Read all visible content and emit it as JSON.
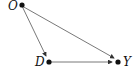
{
  "diagram": {
    "type": "causal-dag",
    "nodes": [
      {
        "id": "O",
        "label": "O"
      },
      {
        "id": "D",
        "label": "D"
      },
      {
        "id": "Y",
        "label": "Y"
      }
    ],
    "edges": [
      {
        "from": "O",
        "to": "D"
      },
      {
        "from": "O",
        "to": "Y"
      },
      {
        "from": "D",
        "to": "Y"
      }
    ],
    "colors": {
      "node": "#111111",
      "edge": "#333333"
    }
  }
}
